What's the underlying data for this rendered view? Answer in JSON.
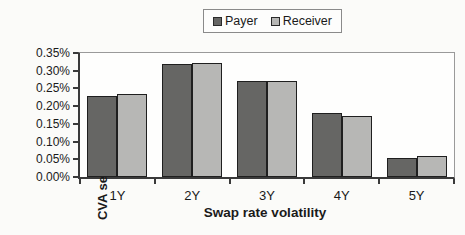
{
  "chart_data": {
    "type": "bar",
    "title": "",
    "xlabel": "Swap rate volatility",
    "ylabel": "CVA sensitivity",
    "categories": [
      "1Y",
      "2Y",
      "3Y",
      "4Y",
      "5Y"
    ],
    "series": [
      {
        "name": "Payer",
        "color": "#666664",
        "values": [
          0.23,
          0.32,
          0.27,
          0.18,
          0.055
        ]
      },
      {
        "name": "Receiver",
        "color": "#b7b7b5",
        "values": [
          0.233,
          0.323,
          0.272,
          0.172,
          0.058
        ]
      }
    ],
    "values_unit": "percent",
    "ylim": [
      0,
      0.35
    ],
    "ytick_step": 0.05,
    "ytick_labels": [
      "0.00%",
      "0.05%",
      "0.10%",
      "0.15%",
      "0.20%",
      "0.25%",
      "0.30%",
      "0.35%"
    ],
    "legend_position": "top-center",
    "legend_entries": [
      "Payer",
      "Receiver"
    ],
    "grid": false,
    "plot_background": "#fefefd",
    "bar_border_color": "#1f1f1f"
  }
}
